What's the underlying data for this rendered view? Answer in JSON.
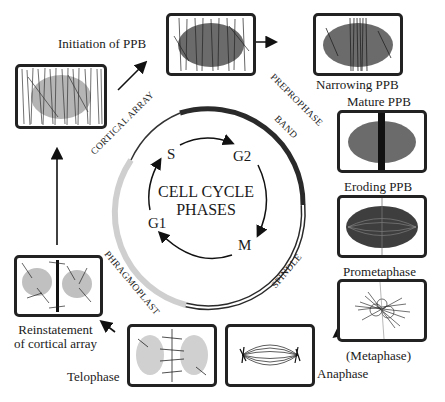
{
  "diagram": {
    "center": {
      "line1": "CELL CYCLE",
      "line2": "PHASES",
      "phases": [
        "S",
        "G2",
        "M",
        "G1"
      ]
    },
    "ring_labels": {
      "cortical_array": "CORTICAL ARRAY",
      "preprophase_band": "PREPROPHASE",
      "preprophase_band_2": "BAND",
      "spindle": "SPINDLE",
      "phragmoplast": "PHRAGMOPLAST"
    },
    "stages": [
      {
        "id": "cortical",
        "label": ""
      },
      {
        "id": "initiation",
        "label": "Initiation of PPB"
      },
      {
        "id": "narrowing",
        "label": "Narrowing PPB"
      },
      {
        "id": "mature",
        "label": "Mature PPB"
      },
      {
        "id": "eroding",
        "label": "Eroding PPB"
      },
      {
        "id": "prometaphase",
        "label": "Prometaphase"
      },
      {
        "id": "metaphase",
        "label": "(Metaphase)"
      },
      {
        "id": "anaphase",
        "label": "Anaphase"
      },
      {
        "id": "telophase",
        "label": "Telophase"
      },
      {
        "id": "reinstatement",
        "label": "Reinstatement",
        "label2": "of cortical array"
      }
    ],
    "colors": {
      "ring_dark": "#2a2a2a",
      "ring_light": "#c8c8c8",
      "nucleus": "#6b6b6b",
      "nucleus_light": "#b5b5b5"
    }
  }
}
